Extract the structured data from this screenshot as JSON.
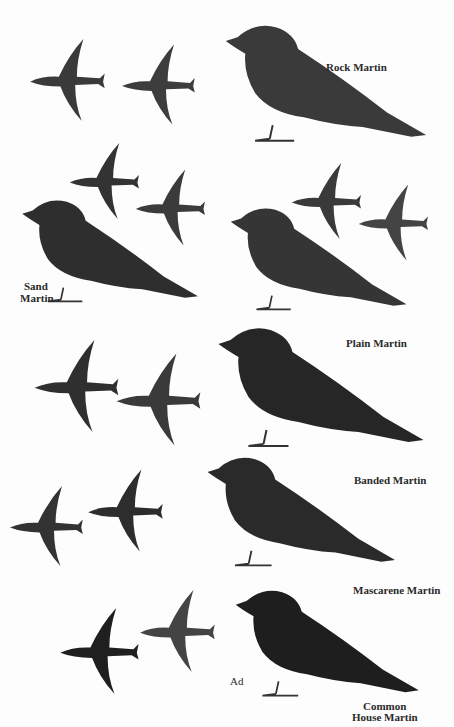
{
  "plate": {
    "description": "Field guide illustration plate of martins, perched and in flight",
    "colors": {
      "background": "#fdfdfd",
      "dark": "#2b2b2b",
      "mid": "#4a4a4a",
      "light": "#e9e9e9"
    },
    "species": [
      {
        "id": "rock",
        "label": "Rock Martin"
      },
      {
        "id": "sand",
        "label_line1": "Sand",
        "label_line2": "Martin"
      },
      {
        "id": "plain",
        "label": "Plain Martin"
      },
      {
        "id": "banded",
        "label": "Banded Martin"
      },
      {
        "id": "mascarene",
        "label": "Mascarene Martin"
      },
      {
        "id": "house",
        "label_line1": "Common",
        "label_line2": "House Martin",
        "age_label": "Ad"
      }
    ]
  }
}
